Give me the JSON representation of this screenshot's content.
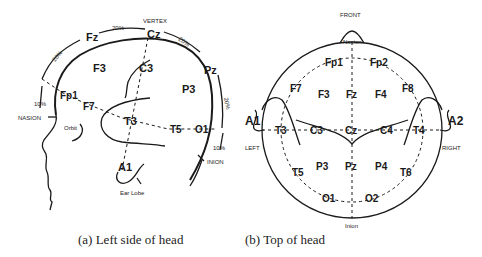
{
  "figure_a": {
    "caption": "(a) Left side of head",
    "landmarks": {
      "vertex": "VERTEX",
      "nasion": "NASION",
      "inion": "INION",
      "orbit": "Orbit",
      "ear_lobe": "Ear Lobe"
    },
    "percent_labels": {
      "fz_cz": "20%",
      "cz_pz": "20%",
      "fp_fz": "20%",
      "pz_o": "20%",
      "nasion_fp": "10%",
      "o_inion": "10%"
    },
    "electrodes": {
      "fz": "Fz",
      "cz": "Cz",
      "pz": "Pz",
      "f3": "F3",
      "c3": "C3",
      "p3": "P3",
      "fp1": "Fp1",
      "f7": "F7",
      "t3": "T3",
      "t5": "T5",
      "o1": "O1",
      "a1": "A1"
    }
  },
  "figure_b": {
    "caption": "(b) Top of head",
    "landmarks": {
      "front": "FRONT",
      "nasion": "Nasion",
      "inion": "Inion",
      "left": "LEFT",
      "right": "RIGHT"
    },
    "electrodes": {
      "fp1": "Fp1",
      "fp2": "Fp2",
      "f7": "F7",
      "f3": "F3",
      "fz": "Fz",
      "f4": "F4",
      "f8": "F8",
      "a1": "A1",
      "t3": "T3",
      "c3": "C3",
      "cz": "Cz",
      "c4": "C4",
      "t4": "T4",
      "a2": "A2",
      "t5": "T5",
      "p3": "P3",
      "pz": "Pz",
      "p4": "P4",
      "t6": "T6",
      "o1": "O1",
      "o2": "O2"
    }
  }
}
